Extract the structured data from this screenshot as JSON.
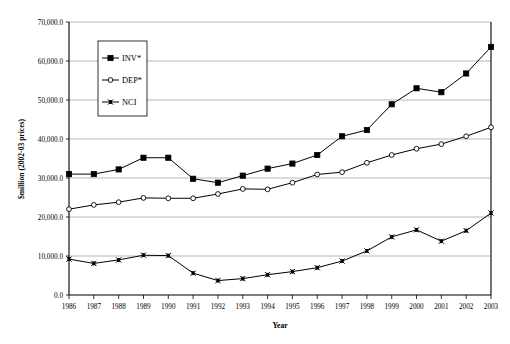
{
  "chart_data": {
    "type": "line",
    "title": "",
    "xlabel": "Year",
    "ylabel": "$million (2002-03 prices)",
    "categories": [
      "1986",
      "1987",
      "1988",
      "1989",
      "1990",
      "1991",
      "1992",
      "1993",
      "1994",
      "1995",
      "1996",
      "1997",
      "1998",
      "1999",
      "2000",
      "2001",
      "2002",
      "2003"
    ],
    "x": [
      1986,
      1987,
      1988,
      1989,
      1990,
      1991,
      1992,
      1993,
      1994,
      1995,
      1996,
      1997,
      1998,
      1999,
      2000,
      2001,
      2002,
      2003
    ],
    "ylim": [
      0,
      70000
    ],
    "xlim": [
      1986,
      2003
    ],
    "ytick_labels": [
      "0.0",
      "10,000.0",
      "20,000.0",
      "30,000.0",
      "40,000.0",
      "50,000.0",
      "60,000.0",
      "70,000.0"
    ],
    "ytick_values": [
      0,
      10000,
      20000,
      30000,
      40000,
      50000,
      60000,
      70000
    ],
    "grid": true,
    "grid_axis": "y",
    "legend_position": "upper-left-inside",
    "series": [
      {
        "name": "INV*",
        "marker": "filled-square",
        "values": [
          31000,
          31000,
          32200,
          35200,
          35200,
          29800,
          28800,
          30600,
          32400,
          33700,
          35900,
          40700,
          42300,
          48900,
          53000,
          52000,
          56800,
          63600
        ]
      },
      {
        "name": "DEP*",
        "marker": "open-circle",
        "values": [
          22000,
          23100,
          23800,
          24900,
          24800,
          24800,
          25900,
          27200,
          27100,
          28800,
          30900,
          31500,
          33900,
          35900,
          37500,
          38700,
          40700,
          43000
        ]
      },
      {
        "name": "NCI",
        "marker": "cross-square",
        "values": [
          9200,
          8100,
          9000,
          10200,
          10100,
          5600,
          3700,
          4200,
          5200,
          6000,
          7000,
          8700,
          11300,
          14900,
          16700,
          13800,
          16500,
          21000
        ]
      }
    ]
  },
  "legend": {
    "items": [
      {
        "label": "INV*"
      },
      {
        "label": "DEP*"
      },
      {
        "label": "NCI"
      }
    ]
  },
  "axes": {
    "x_title": "Year",
    "y_title": "$million (2002-03 prices)"
  }
}
